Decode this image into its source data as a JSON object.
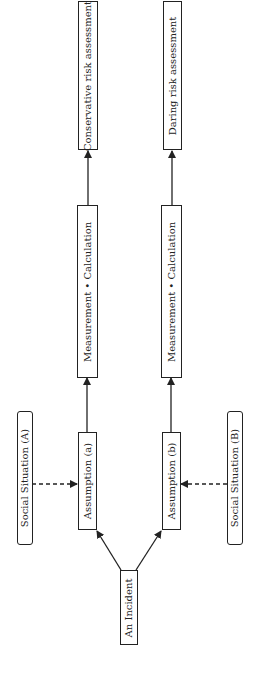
{
  "diagram": {
    "orientation": "rotated -90deg (flow bottom to top)",
    "nodes": {
      "incident": {
        "label": "An Incident"
      },
      "assumption_a": {
        "label": "Assumption (a)"
      },
      "assumption_b": {
        "label": "Assumption (b)"
      },
      "social_a": {
        "label": "Social Situation (A)"
      },
      "social_b": {
        "label": "Social Situation (B)"
      },
      "measure_a": {
        "label": "Measurement • Calculation"
      },
      "measure_b": {
        "label": "Measurement • Calculation"
      },
      "conservative": {
        "label": "Conservative risk assessment"
      },
      "daring": {
        "label": "Daring risk assessment"
      }
    },
    "edges": [
      {
        "from": "incident",
        "to": "assumption_a",
        "style": "solid"
      },
      {
        "from": "incident",
        "to": "assumption_b",
        "style": "solid"
      },
      {
        "from": "social_a",
        "to": "assumption_a",
        "style": "dashed"
      },
      {
        "from": "social_b",
        "to": "assumption_b",
        "style": "dashed"
      },
      {
        "from": "assumption_a",
        "to": "measure_a",
        "style": "solid"
      },
      {
        "from": "assumption_b",
        "to": "measure_b",
        "style": "solid"
      },
      {
        "from": "measure_a",
        "to": "conservative",
        "style": "solid"
      },
      {
        "from": "measure_b",
        "to": "daring",
        "style": "solid"
      }
    ],
    "colors": {
      "stroke": "#222222",
      "background": "#ffffff"
    }
  }
}
